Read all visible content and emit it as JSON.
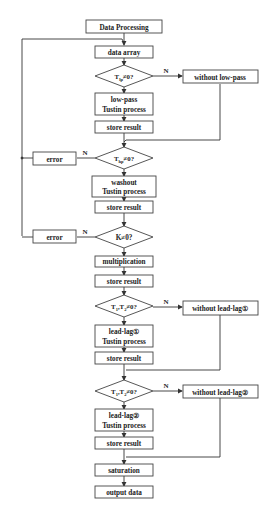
{
  "diagram": {
    "title": "Data Processing",
    "nodes": {
      "start": "Data Processing",
      "data_array": "data array",
      "cond_lp": {
        "main": "T",
        "sub": "lp",
        "rest": "≠0?"
      },
      "without_lp": "without low-pass",
      "lowpass_l1": "low-pass",
      "lowpass_l2": "Tustin process",
      "store1": "store result",
      "cond_hp": {
        "main": "T",
        "sub": "hp",
        "rest": "≠0?"
      },
      "error1": "error",
      "washout_l1": "washout",
      "washout_l2": "Tustin process",
      "store2": "store result",
      "cond_k": "K≠0?",
      "error2": "error",
      "multiplication": "multiplication",
      "store3": "store result",
      "cond_t12a": {
        "t1": "T",
        "s1": "1",
        "sep": ",T",
        "s2": "2",
        "rest": "≠0?"
      },
      "without_ll1": "without lead-lag①",
      "ll1_l1": "lead-lag①",
      "ll1_l2": "Tustin process",
      "store4": "store result",
      "cond_t12b": {
        "t1": "T",
        "s1": "1",
        "sep": ",T",
        "s2": "2",
        "rest": "≠0?"
      },
      "without_ll2": "without lead-lag②",
      "ll2_l1": "lead-lag②",
      "ll2_l2": "Tustin process",
      "store5": "store result",
      "saturation": "saturation",
      "output": "output data"
    },
    "edge_labels": {
      "no": "N"
    },
    "colors": {
      "line": "#333333",
      "box_border": "#444444",
      "text": "#222222",
      "background": "#ffffff"
    }
  }
}
